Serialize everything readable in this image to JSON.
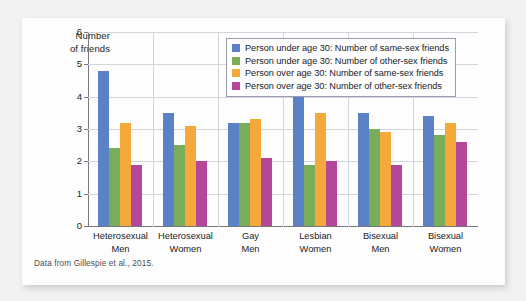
{
  "figure": {
    "caption": "Data from Gillespie et al., 2015."
  },
  "chart_data": {
    "type": "bar",
    "title": "",
    "xlabel": "",
    "ylabel": "Number of friends",
    "ylim": [
      0,
      6
    ],
    "yticks": [
      "0",
      "1",
      "2",
      "3",
      "4",
      "5",
      "6"
    ],
    "grid": true,
    "legend_position": "top-right",
    "categories": [
      "Heterosexual Men",
      "Heterosexual Women",
      "Gay Men",
      "Lesbian Women",
      "Bisexual Men",
      "Bisexual Women"
    ],
    "category_lines": [
      [
        "Heterosexual",
        "Men"
      ],
      [
        "Heterosexual",
        "Women"
      ],
      [
        "Gay",
        "Men"
      ],
      [
        "Lesbian",
        "Women"
      ],
      [
        "Bisexual",
        "Men"
      ],
      [
        "Bisexual",
        "Women"
      ]
    ],
    "series": [
      {
        "name": "Person under age 30: Number of same-sex friends",
        "color": "#5b81c6",
        "values": [
          4.8,
          3.5,
          3.2,
          4.0,
          3.5,
          3.4
        ]
      },
      {
        "name": "Person under age 30: Number of other-sex friends",
        "color": "#79ac5b",
        "values": [
          2.4,
          2.5,
          3.2,
          1.9,
          3.0,
          2.8
        ]
      },
      {
        "name": "Person over age 30: Number of same-sex friends",
        "color": "#f4a93a",
        "values": [
          3.2,
          3.1,
          3.3,
          3.5,
          2.9,
          3.2
        ]
      },
      {
        "name": "Person over age 30: Number of other-sex friends",
        "color": "#b5479b",
        "values": [
          1.9,
          2.0,
          2.1,
          2.0,
          1.9,
          2.6
        ]
      }
    ]
  }
}
